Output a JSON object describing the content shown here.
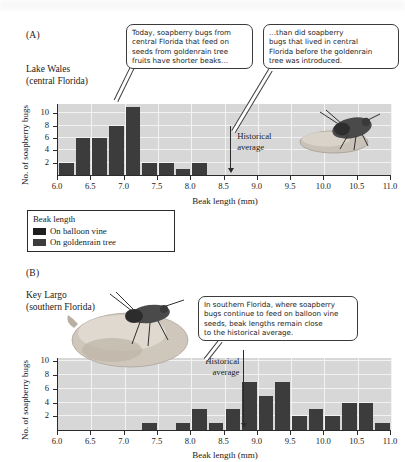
{
  "figure": {
    "panel_a": {
      "letter": "(A)",
      "location_line1": "Lake Wales",
      "location_line2": "(central Florida)",
      "callout_1": [
        "Today, soapberry bugs from",
        "central Florida that feed on",
        "seeds from goldenrain tree",
        "fruits have shorter beaks…"
      ],
      "callout_2": [
        "…than did soapberry",
        "bugs that lived in central",
        "Florida before the goldenrain",
        "tree was introduced."
      ],
      "historical_label": [
        "Historical",
        "average"
      ]
    },
    "panel_b": {
      "letter": "(B)",
      "location_line1": "Key Largo",
      "location_line2": "(southern Florida)",
      "callout_1": [
        "In southern Florida, where soapberry",
        "bugs continue to feed on balloon vine",
        "seeds, beak lengths remain close",
        "to the historical average."
      ],
      "historical_label": [
        "Historical",
        "average"
      ]
    },
    "legend": {
      "title": "Beak length",
      "items": [
        {
          "label": "On balloon vine",
          "color": "#1e1e1e"
        },
        {
          "label": "On goldenrain tree",
          "color": "#3c3c3c"
        }
      ]
    },
    "colors": {
      "bar": "#3c3c3c",
      "plot_background": "#d7d7d7",
      "gridline": "#f2f2f2",
      "axis": "#2b2b2b"
    }
  },
  "chart_data": [
    {
      "type": "bar",
      "title": "Lake Wales (central Florida)",
      "xlabel": "Beak length (mm)",
      "ylabel": "No. of soapberry bugs",
      "xlim": [
        6.0,
        11.0
      ],
      "ylim": [
        0,
        11.5
      ],
      "xticks": [
        "6.0",
        "6.5",
        "7.0",
        "7.5",
        "8.0",
        "8.5",
        "9.0",
        "9.5",
        "10.0",
        "10.5",
        "11.0"
      ],
      "yticks": [
        "2",
        "4",
        "6",
        "8",
        "10"
      ],
      "bin_width": 0.25,
      "grid": true,
      "bin_starts": [
        6.0,
        6.25,
        6.5,
        6.75,
        7.0,
        7.25,
        7.5,
        7.75,
        8.0,
        8.25,
        8.5,
        8.75,
        9.0,
        9.25,
        9.5,
        9.75,
        10.0,
        10.25,
        10.5,
        10.75
      ],
      "values": [
        2,
        6,
        6,
        8,
        11,
        2,
        2,
        1,
        2,
        0,
        0,
        0,
        0,
        0,
        0,
        0,
        0,
        0,
        0,
        0
      ],
      "annotations": [
        {
          "text": "Historical average",
          "x": 8.6,
          "type": "arrow-down"
        }
      ]
    },
    {
      "type": "bar",
      "title": "Key Largo (southern Florida)",
      "xlabel": "Beak length (mm)",
      "ylabel": "No. of soapberry bugs",
      "xlim": [
        6.0,
        11.0
      ],
      "ylim": [
        0,
        10.5
      ],
      "xticks": [
        "6.0",
        "6.5",
        "7.0",
        "7.5",
        "8.0",
        "8.5",
        "9.0",
        "9.5",
        "10.0",
        "10.5",
        "11.0"
      ],
      "yticks": [
        "2",
        "4",
        "6",
        "8",
        "10"
      ],
      "bin_width": 0.25,
      "grid": true,
      "bin_starts": [
        6.0,
        6.25,
        6.5,
        6.75,
        7.0,
        7.25,
        7.5,
        7.75,
        8.0,
        8.25,
        8.5,
        8.75,
        9.0,
        9.25,
        9.5,
        9.75,
        10.0,
        10.25,
        10.5,
        10.75
      ],
      "values": [
        0,
        0,
        0,
        0,
        0,
        1,
        0,
        1,
        3,
        1,
        3,
        7,
        5,
        7,
        2,
        3,
        2,
        4,
        4,
        1
      ],
      "annotations": [
        {
          "text": "Historical average",
          "x": 8.8,
          "type": "arrow-down"
        }
      ]
    }
  ]
}
